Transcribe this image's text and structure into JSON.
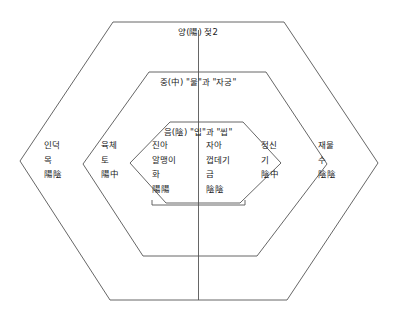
{
  "diagram": {
    "type": "nested-hexagon-concept-diagram",
    "bands": [
      {
        "id": "outer",
        "title": "양(陽) 젖2",
        "columns": [
          {
            "id": "outer-left",
            "lines": [
              "인덕",
              "목",
              "陽陰"
            ]
          },
          {
            "id": "outer-right",
            "lines": [
              "재물",
              "수",
              "陰陰"
            ]
          }
        ]
      },
      {
        "id": "middle",
        "title": "중(中) \"물\"과 \"자궁\"",
        "columns": [
          {
            "id": "middle-left",
            "lines": [
              "육체",
              "토",
              "陽中"
            ]
          },
          {
            "id": "middle-right",
            "lines": [
              "정신",
              "기",
              "陰中"
            ]
          }
        ]
      },
      {
        "id": "inner",
        "title": "음(陰) \"입\"과 \"씹\"",
        "columns": [
          {
            "id": "inner-left",
            "lines": [
              "진아",
              "알맹이",
              "화",
              "陽陽"
            ]
          },
          {
            "id": "inner-right",
            "lines": [
              "자아",
              "껍데기",
              "금",
              "陰陰"
            ]
          }
        ]
      }
    ],
    "colors": {
      "stroke": "#555555",
      "text": "#1a1a1a",
      "background": "#ffffff"
    }
  }
}
